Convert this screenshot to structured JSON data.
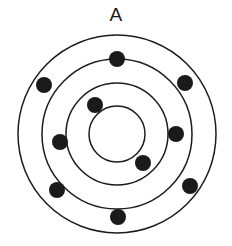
{
  "figure": {
    "panel_label": "A",
    "background_color": "#ffffff",
    "canvas": {
      "width": 232,
      "height": 246
    }
  },
  "diagram": {
    "type": "concentric-rings-with-markers",
    "center": {
      "x": 117,
      "y": 134
    },
    "stroke_color": "#1c1c1c",
    "marker_color": "#1a1a1a",
    "rings": [
      {
        "name": "ring-outer",
        "radius": 99,
        "stroke_width": 1.5
      },
      {
        "name": "ring-second",
        "radius": 75,
        "stroke_width": 1.5
      },
      {
        "name": "ring-third",
        "radius": 51,
        "stroke_width": 1.5
      },
      {
        "name": "ring-inner",
        "radius": 28,
        "stroke_width": 1.5
      }
    ],
    "markers": [
      {
        "name": "marker-top",
        "x": 117,
        "y": 59,
        "r": 8,
        "ring": "ring-second"
      },
      {
        "name": "marker-upper-right",
        "x": 185,
        "y": 83,
        "r": 8,
        "ring": "ring-outer"
      },
      {
        "name": "marker-right",
        "x": 176,
        "y": 134,
        "r": 8,
        "ring": "ring-second"
      },
      {
        "name": "marker-lower-right",
        "x": 190,
        "y": 186,
        "r": 8,
        "ring": "ring-outer"
      },
      {
        "name": "marker-bottom",
        "x": 118,
        "y": 217,
        "r": 8,
        "ring": "ring-outer"
      },
      {
        "name": "marker-lower-left",
        "x": 57,
        "y": 190,
        "r": 8,
        "ring": "ring-outer"
      },
      {
        "name": "marker-left",
        "x": 60,
        "y": 142,
        "r": 8,
        "ring": "ring-third"
      },
      {
        "name": "marker-upper-left",
        "x": 44,
        "y": 85,
        "r": 8,
        "ring": "ring-outer"
      },
      {
        "name": "marker-inner-upper-left",
        "x": 95,
        "y": 105,
        "r": 8,
        "ring": "ring-third"
      },
      {
        "name": "marker-inner-lower-right",
        "x": 143,
        "y": 163,
        "r": 8,
        "ring": "ring-third"
      }
    ]
  }
}
